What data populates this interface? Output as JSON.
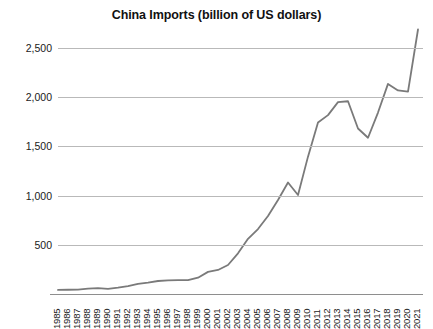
{
  "chart_data": {
    "type": "line",
    "title": "China Imports (billion of US dollars)",
    "xlabel": "",
    "ylabel": "",
    "ylim": [
      0,
      3000
    ],
    "grid": true,
    "legend": false,
    "legend_position": "none",
    "line_color": "#7a7a7a",
    "grid_color": "#b9b9b9",
    "axis_color": "#8e8e8e",
    "y_ticks": [
      500,
      1000,
      1500,
      2000,
      2500
    ],
    "y_tick_labels": [
      "500",
      "1,000",
      "1,500",
      "2,000",
      "2,500"
    ],
    "categories": [
      "1985",
      "1986",
      "1987",
      "1988",
      "1989",
      "1990",
      "1991",
      "1992",
      "1993",
      "1994",
      "1995",
      "1996",
      "1997",
      "1998",
      "1999",
      "2000",
      "2001",
      "2002",
      "2003",
      "2004",
      "2005",
      "2006",
      "2007",
      "2008",
      "2009",
      "2010",
      "2011",
      "2012",
      "2013",
      "2014",
      "2015",
      "2016",
      "2017",
      "2018",
      "2019",
      "2020",
      "2021"
    ],
    "values": [
      42,
      43,
      44,
      55,
      59,
      53,
      64,
      81,
      104,
      116,
      132,
      139,
      142,
      140,
      166,
      225,
      244,
      295,
      413,
      561,
      660,
      792,
      956,
      1133,
      1006,
      1396,
      1743,
      1818,
      1950,
      1959,
      1682,
      1588,
      1844,
      2135,
      2069,
      2056,
      2688
    ],
    "series": [
      {
        "name": "China Imports",
        "values": [
          42,
          43,
          44,
          55,
          59,
          53,
          64,
          81,
          104,
          116,
          132,
          139,
          142,
          140,
          166,
          225,
          244,
          295,
          413,
          561,
          660,
          792,
          956,
          1133,
          1006,
          1396,
          1743,
          1818,
          1950,
          1959,
          1682,
          1588,
          1844,
          2135,
          2069,
          2056,
          2688
        ]
      }
    ]
  }
}
